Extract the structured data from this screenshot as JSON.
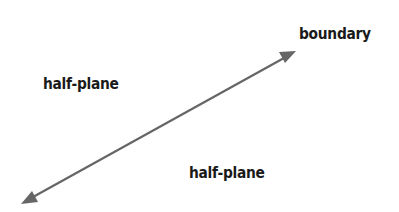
{
  "diagram": {
    "labels": {
      "boundary": "boundary",
      "half_plane_upper": "half-plane",
      "half_plane_lower": "half-plane"
    },
    "boundary_line": {
      "type": "double-headed-arrow",
      "start": [
        21,
        204
      ],
      "end": [
        296,
        51
      ],
      "color": "#666666"
    }
  }
}
